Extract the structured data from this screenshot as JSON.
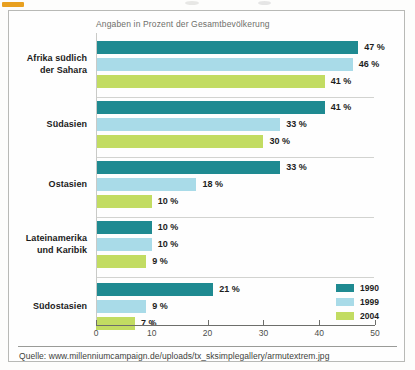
{
  "chart_data": {
    "type": "bar",
    "orientation": "horizontal",
    "title": "",
    "subtitle": "Angaben in Prozent der Gesamtbevölkerung",
    "xlabel": "",
    "ylabel": "",
    "xlim": [
      0,
      50
    ],
    "xticks": [
      0,
      10,
      20,
      30,
      40,
      50
    ],
    "xtick_labels": [
      "0",
      "10",
      "20",
      "30",
      "40",
      "50"
    ],
    "grid": false,
    "legend_position": "bottom-right",
    "categories": [
      "Afrika südlich der Sahara",
      "Südasien",
      "Ostasien",
      "Lateinamerika und Karibik",
      "Südostasien"
    ],
    "series": [
      {
        "name": "1990",
        "color": "#1f8a91",
        "values": [
          47,
          41,
          33,
          10,
          21
        ]
      },
      {
        "name": "1999",
        "color": "#a9dbe8",
        "values": [
          46,
          33,
          18,
          10,
          9
        ]
      },
      {
        "name": "2004",
        "color": "#c2dc62",
        "values": [
          41,
          30,
          10,
          9,
          7
        ]
      }
    ],
    "value_labels": [
      [
        "47 %",
        "46 %",
        "41 %"
      ],
      [
        "41 %",
        "33 %",
        "30 %"
      ],
      [
        "33 %",
        "18 %",
        "10 %"
      ],
      [
        "10 %",
        "10 %",
        "9 %"
      ],
      [
        "21 %",
        "9 %",
        "7 %"
      ]
    ]
  },
  "groups": [
    {
      "label_line1": "Afrika südlich",
      "label_line2": "der Sahara",
      "bars": [
        {
          "series": "1990",
          "value": 47,
          "label": "47 %",
          "color": "#1f8a91"
        },
        {
          "series": "1999",
          "value": 46,
          "label": "46 %",
          "color": "#a9dbe8"
        },
        {
          "series": "2004",
          "value": 41,
          "label": "41 %",
          "color": "#c2dc62"
        }
      ]
    },
    {
      "label_line1": "Südasien",
      "label_line2": "",
      "bars": [
        {
          "series": "1990",
          "value": 41,
          "label": "41 %",
          "color": "#1f8a91"
        },
        {
          "series": "1999",
          "value": 33,
          "label": "33 %",
          "color": "#a9dbe8"
        },
        {
          "series": "2004",
          "value": 30,
          "label": "30 %",
          "color": "#c2dc62"
        }
      ]
    },
    {
      "label_line1": "Ostasien",
      "label_line2": "",
      "bars": [
        {
          "series": "1990",
          "value": 33,
          "label": "33 %",
          "color": "#1f8a91"
        },
        {
          "series": "1999",
          "value": 18,
          "label": "18 %",
          "color": "#a9dbe8"
        },
        {
          "series": "2004",
          "value": 10,
          "label": "10 %",
          "color": "#c2dc62"
        }
      ]
    },
    {
      "label_line1": "Lateinamerika",
      "label_line2": "und Karibik",
      "bars": [
        {
          "series": "1990",
          "value": 10,
          "label": "10 %",
          "color": "#1f8a91"
        },
        {
          "series": "1999",
          "value": 10,
          "label": "10 %",
          "color": "#a9dbe8"
        },
        {
          "series": "2004",
          "value": 9,
          "label": "9 %",
          "color": "#c2dc62"
        }
      ]
    },
    {
      "label_line1": "Südostasien",
      "label_line2": "",
      "bars": [
        {
          "series": "1990",
          "value": 21,
          "label": "21 %",
          "color": "#1f8a91"
        },
        {
          "series": "1999",
          "value": 9,
          "label": "9 %",
          "color": "#a9dbe8"
        },
        {
          "series": "2004",
          "value": 7,
          "label": "7 %",
          "color": "#c2dc62"
        }
      ]
    }
  ],
  "legend": {
    "entries": [
      {
        "label": "1990",
        "color": "#1f8a91"
      },
      {
        "label": "1999",
        "color": "#a9dbe8"
      },
      {
        "label": "2004",
        "color": "#c2dc62"
      }
    ]
  },
  "axis": {
    "tick_labels": [
      "0",
      "10",
      "20",
      "30",
      "40",
      "50"
    ]
  },
  "source": {
    "text": "Quelle: www.millenniumcampaign.de/uploads/tx_sksimplegallery/armutextrem.jpg"
  }
}
